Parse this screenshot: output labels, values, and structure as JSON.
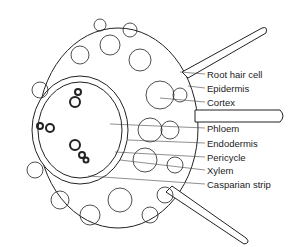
{
  "diagram": {
    "labels": [
      {
        "id": "root-hair-cell",
        "text": "Root hair cell",
        "x": 207,
        "y": 70
      },
      {
        "id": "epidermis",
        "text": "Epidermis",
        "x": 207,
        "y": 84
      },
      {
        "id": "cortex",
        "text": "Cortex",
        "x": 207,
        "y": 98
      },
      {
        "id": "phloem",
        "text": "Phloem",
        "x": 207,
        "y": 124
      },
      {
        "id": "endodermis",
        "text": "Endodermis",
        "x": 207,
        "y": 139
      },
      {
        "id": "pericycle",
        "text": "Pericycle",
        "x": 207,
        "y": 153
      },
      {
        "id": "xylem",
        "text": "Xylem",
        "x": 207,
        "y": 166
      },
      {
        "id": "casparian-strip",
        "text": "Casparian strip",
        "x": 207,
        "y": 180
      }
    ]
  }
}
